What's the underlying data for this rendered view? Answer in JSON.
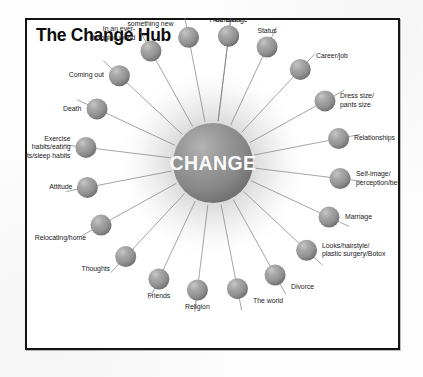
{
  "page": {
    "title": "The Change Hub",
    "frame_border_color": "#141414",
    "background_color": "#ffffff"
  },
  "hub": {
    "center_label": "CHANGE",
    "center_color": "#8e8e8e",
    "node_color": "#9a9a9a",
    "spoke_color": "#7b7b7b",
    "glow_color": "#cfcfcf"
  },
  "chart_data": {
    "type": "diagram",
    "layout": "radial-hub-and-spoke",
    "title": "The Change Hub",
    "center": "CHANGE",
    "node_count": 20,
    "nodes": [
      {
        "label": "Behavior",
        "angle_deg": -83,
        "label_pos": "above"
      },
      {
        "label": "Status",
        "angle_deg": -65,
        "label_pos": "above"
      },
      {
        "label": "Career/job",
        "angle_deg": -47,
        "label_pos": "above-right"
      },
      {
        "label": "Dress size/\npants size",
        "angle_deg": -29,
        "label_pos": "right"
      },
      {
        "label": "Relationships",
        "angle_deg": -11,
        "label_pos": "right"
      },
      {
        "label": "Self-image/\nperception/beliefs",
        "angle_deg": 7,
        "label_pos": "right"
      },
      {
        "label": "Marriage",
        "angle_deg": 25,
        "label_pos": "right"
      },
      {
        "label": "Looks/hairstyle/\nplastic surgery/Botox",
        "angle_deg": 43,
        "label_pos": "right"
      },
      {
        "label": "Divorce",
        "angle_deg": 61,
        "label_pos": "below-right"
      },
      {
        "label": "The world",
        "angle_deg": 79,
        "label_pos": "below-right"
      },
      {
        "label": "Religion",
        "angle_deg": 97,
        "label_pos": "below"
      },
      {
        "label": "Friends",
        "angle_deg": 115,
        "label_pos": "below"
      },
      {
        "label": "Thoughts",
        "angle_deg": 133,
        "label_pos": "below-left"
      },
      {
        "label": "Relocating/home",
        "angle_deg": 151,
        "label_pos": "below-left"
      },
      {
        "label": "Attitude",
        "angle_deg": 169,
        "label_pos": "left"
      },
      {
        "label": "Exercise\nhabits/eating\nhabits/sleep habits",
        "angle_deg": 187,
        "label_pos": "left"
      },
      {
        "label": "Death",
        "angle_deg": 205,
        "label_pos": "left"
      },
      {
        "label": "Coming out",
        "angle_deg": 223,
        "label_pos": "left"
      },
      {
        "label": "In an ever-\nchanging world",
        "angle_deg": 241,
        "label_pos": "above-left"
      },
      {
        "label": "Learning\nsomething new",
        "angle_deg": 259,
        "label_pos": "above-left"
      },
      {
        "label": "I AM change",
        "angle_deg": 277,
        "label_pos": "above"
      }
    ]
  }
}
